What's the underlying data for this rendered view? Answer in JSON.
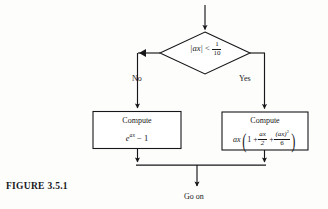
{
  "figure": {
    "caption": "FIGURE 3.5.1",
    "background_color": "#fdfdfc",
    "line_color": "#17171a"
  },
  "flowchart": {
    "entry_arrow": {
      "name": "entry-arrow",
      "from_y": 5,
      "to_y": 32,
      "x": 205
    },
    "decision": {
      "label_plain": "|ax| < 1/10",
      "abs_open": "|",
      "variable": "ax",
      "abs_close": "|",
      "operator": "<",
      "fraction_numerator": "1",
      "fraction_denominator": "10",
      "shape": "diamond"
    },
    "branches": [
      {
        "key": "no",
        "label": "No",
        "target": "left-process"
      },
      {
        "key": "yes",
        "label": "Yes",
        "target": "right-process"
      }
    ],
    "processes": [
      {
        "key": "left-process",
        "title": "Compute",
        "expression_plain": "e^{ax} - 1",
        "base": "e",
        "exponent": "ax",
        "minus": "−",
        "one": "1"
      },
      {
        "key": "right-process",
        "title": "Compute",
        "expression_plain": "ax ( 1 + ax/2 + (ax)^2/6 )",
        "coefficient": "ax",
        "paren_open": "(",
        "term1": "1",
        "plus1": "+",
        "term2_numerator": "ax",
        "term2_denominator": "2",
        "plus2": "+",
        "term3_numerator": "(ax)",
        "term3_exponent": "2",
        "term3_denominator": "6",
        "paren_close": ")"
      }
    ],
    "exit": {
      "label": "Go on",
      "merge_line_y": 165,
      "arrow_x": 197
    }
  }
}
